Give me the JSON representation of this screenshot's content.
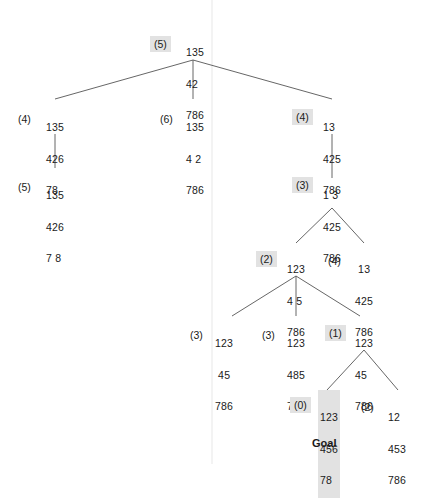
{
  "highlight_color": "#e2e2e2",
  "nodes": [
    {
      "id": "root",
      "rows": [
        "135",
        "42 ",
        "786"
      ],
      "h": "(5)",
      "on_path": true
    },
    {
      "id": "n1a",
      "rows": [
        "135",
        "426",
        "78 "
      ],
      "h": "(4)",
      "on_path": false
    },
    {
      "id": "n1b",
      "rows": [
        "135",
        "4 2",
        "786"
      ],
      "h": "(6)",
      "on_path": false
    },
    {
      "id": "n1c",
      "rows": [
        "13 ",
        "425",
        "786"
      ],
      "h": "(4)",
      "on_path": true
    },
    {
      "id": "n2a",
      "rows": [
        "135",
        "426",
        "7 8"
      ],
      "h": "(5)",
      "on_path": false
    },
    {
      "id": "n2c",
      "rows": [
        "1 3",
        "425",
        "786"
      ],
      "h": "(3)",
      "on_path": true
    },
    {
      "id": "n3a",
      "rows": [
        "123",
        "4 5",
        "786"
      ],
      "h": "(2)",
      "on_path": true
    },
    {
      "id": "n3b",
      "rows": [
        " 13",
        "425",
        "786"
      ],
      "h": "(4)",
      "on_path": false
    },
    {
      "id": "n4a",
      "rows": [
        "123",
        " 45",
        "786"
      ],
      "h": "(3)",
      "on_path": false
    },
    {
      "id": "n4b",
      "rows": [
        "123",
        "485",
        "7 6"
      ],
      "h": "(3)",
      "on_path": false
    },
    {
      "id": "n4c",
      "rows": [
        "123",
        "45 ",
        "786"
      ],
      "h": "(1)",
      "on_path": true
    },
    {
      "id": "goal",
      "rows": [
        "123",
        "456",
        "78 "
      ],
      "h": "(0)",
      "on_path": true
    },
    {
      "id": "n5b",
      "rows": [
        "12 ",
        "453",
        "786"
      ],
      "h": "(2)",
      "on_path": false
    }
  ],
  "goal_label": "Goal"
}
